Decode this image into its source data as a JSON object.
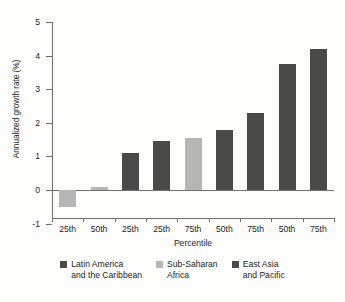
{
  "chart_data": {
    "type": "bar",
    "title": "",
    "xlabel": "Percentile",
    "ylabel": "Annualized growth rate (%)",
    "ylim": [
      -1,
      5
    ],
    "yticks": [
      5,
      4,
      3,
      2,
      1,
      0,
      -1
    ],
    "ytick_labels": [
      "5",
      "4",
      "3",
      "2",
      "1",
      "0",
      "-1"
    ],
    "grid": false,
    "legend_position": "bottom",
    "categories": [
      "25th",
      "50th",
      "25th",
      "25th",
      "75th",
      "50th",
      "75th",
      "50th",
      "75th"
    ],
    "values": [
      -0.5,
      0.1,
      1.1,
      1.45,
      1.55,
      1.78,
      2.28,
      3.75,
      4.2
    ],
    "bar_groups": [
      "Sub-Saharan Africa",
      "Sub-Saharan Africa",
      "Latin America and the Caribbean",
      "Latin America and the Caribbean",
      "Sub-Saharan Africa",
      "East Asia and Pacific",
      "Latin America and the Caribbean",
      "East Asia and Pacific",
      "East Asia and Pacific"
    ],
    "series": [
      {
        "name": "Latin America and the Caribbean",
        "color": "#4a4a4a",
        "points": [
          {
            "category": "25th",
            "index": 2,
            "value": 1.1
          },
          {
            "category": "25th",
            "index": 3,
            "value": 1.45
          },
          {
            "category": "75th",
            "index": 6,
            "value": 2.28
          }
        ]
      },
      {
        "name": "Sub-Saharan Africa",
        "color": "#b6b6b6",
        "points": [
          {
            "category": "25th",
            "index": 0,
            "value": -0.5
          },
          {
            "category": "50th",
            "index": 1,
            "value": 0.1
          },
          {
            "category": "75th",
            "index": 4,
            "value": 1.55
          }
        ]
      },
      {
        "name": "East Asia and Pacific",
        "color": "#4a4a4a",
        "points": [
          {
            "category": "50th",
            "index": 5,
            "value": 1.78
          },
          {
            "category": "50th",
            "index": 7,
            "value": 3.75
          },
          {
            "category": "75th",
            "index": 8,
            "value": 4.2
          }
        ]
      }
    ]
  },
  "axes": {
    "y_title": "Annualized growth rate (%)",
    "x_title": "Percentile",
    "y_labels": [
      "5",
      "4",
      "3",
      "2",
      "1",
      "0",
      "-1"
    ],
    "x_labels": [
      "25th",
      "50th",
      "25th",
      "25th",
      "75th",
      "50th",
      "75th",
      "50th",
      "75th"
    ]
  },
  "legend": {
    "items": [
      {
        "line1": "Latin America",
        "line2": "and the Caribbean",
        "color": "#4a4a4a"
      },
      {
        "line1": "Sub-Saharan",
        "line2": "Africa",
        "color": "#b6b6b6"
      },
      {
        "line1": "East Asia",
        "line2": "and Pacific",
        "color": "#4a4a4a"
      }
    ]
  },
  "colors": {
    "dark": "#4a4a4a",
    "light": "#b6b6b6",
    "axis": "#6f6f6f",
    "text": "#231f20",
    "background": "#fdfdfc"
  }
}
